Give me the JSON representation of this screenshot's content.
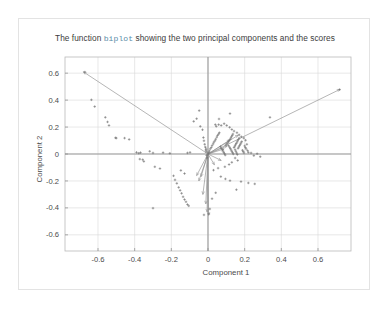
{
  "figure": {
    "title_prefix": "The function ",
    "title_code": "biplot",
    "title_suffix": " showing the two principal components and the scores",
    "title_full": "The function biplot showing the two principal components and the scores",
    "code_token_color": "#5b8ca8",
    "frame_border_color": "#e3e3e3",
    "background_color": "#ffffff"
  },
  "chart_data": {
    "type": "scatter",
    "title": "The function biplot showing the two principal components and the scores",
    "xlabel": "Component 1",
    "ylabel": "Component 2",
    "xlim": [
      -0.78,
      0.78
    ],
    "ylim": [
      -0.72,
      0.72
    ],
    "xticks": [
      -0.6,
      -0.4,
      -0.2,
      0,
      0.2,
      0.4,
      0.6
    ],
    "xticklabels": [
      "-0.6",
      "-0.4",
      "-0.2",
      "0",
      "0.2",
      "0.4",
      "0.6"
    ],
    "yticks": [
      -0.6,
      -0.4,
      -0.2,
      0,
      0.2,
      0.4,
      0.6
    ],
    "yticklabels": [
      "-0.6",
      "-0.4",
      "-0.2",
      "0",
      "0.2",
      "0.4",
      "0.6"
    ],
    "grid": true,
    "grid_color": "#d8d8d8",
    "axis_line_color": "#9a9a9a",
    "legend": null,
    "series": [
      {
        "name": "loading vectors",
        "type": "vectors",
        "color": "#8e8e8e",
        "origin": [
          0,
          0
        ],
        "vectors": [
          [
            -0.68,
            0.61
          ],
          [
            0.72,
            0.48
          ],
          [
            0.165,
            0.14
          ],
          [
            0.12,
            0.105
          ],
          [
            0.105,
            0.06
          ],
          [
            0.088,
            0.038
          ],
          [
            -0.013,
            0.05
          ],
          [
            0.035,
            -0.08
          ],
          [
            0.072,
            -0.048
          ],
          [
            -0.062,
            -0.16
          ],
          [
            -0.05,
            -0.2
          ],
          [
            -0.038,
            -0.168
          ],
          [
            -0.028,
            -0.3
          ],
          [
            -0.012,
            -0.37
          ],
          [
            -0.005,
            -0.43
          ],
          [
            0.003,
            -0.455
          ]
        ]
      },
      {
        "name": "scores",
        "type": "points",
        "color": "#6e6e6e",
        "points": [
          [
            -0.672,
            0.608
          ],
          [
            -0.636,
            0.402
          ],
          [
            -0.618,
            0.352
          ],
          [
            -0.56,
            0.272
          ],
          [
            -0.548,
            0.238
          ],
          [
            -0.54,
            0.212
          ],
          [
            -0.505,
            0.12
          ],
          [
            -0.5,
            0.118
          ],
          [
            -0.455,
            0.118
          ],
          [
            -0.43,
            0.108
          ],
          [
            -0.39,
            0.012
          ],
          [
            -0.378,
            0.006
          ],
          [
            -0.368,
            0.01
          ],
          [
            -0.372,
            -0.038
          ],
          [
            -0.356,
            -0.042
          ],
          [
            -0.35,
            -0.055
          ],
          [
            -0.318,
            0.02
          ],
          [
            -0.3,
            0.008
          ],
          [
            -0.29,
            -0.095
          ],
          [
            -0.262,
            -0.108
          ],
          [
            -0.245,
            0.01
          ],
          [
            -0.208,
            0.005
          ],
          [
            -0.188,
            -0.162
          ],
          [
            -0.18,
            -0.192
          ],
          [
            -0.17,
            -0.218
          ],
          [
            -0.16,
            -0.248
          ],
          [
            -0.152,
            -0.27
          ],
          [
            -0.144,
            -0.292
          ],
          [
            -0.136,
            -0.318
          ],
          [
            -0.128,
            -0.338
          ],
          [
            -0.12,
            -0.355
          ],
          [
            -0.112,
            -0.375
          ],
          [
            -0.105,
            -0.385
          ],
          [
            -0.148,
            -0.122
          ],
          [
            -0.128,
            -0.145
          ],
          [
            -0.112,
            0.008
          ],
          [
            -0.098,
            0.012
          ],
          [
            -0.078,
            0.242
          ],
          [
            -0.062,
            0.262
          ],
          [
            -0.048,
            0.322
          ],
          [
            -0.042,
            0.205
          ],
          [
            -0.03,
            0.18
          ],
          [
            -0.025,
            0.122
          ],
          [
            -0.022,
            0.098
          ],
          [
            -0.018,
            0.072
          ],
          [
            -0.015,
            0.052
          ],
          [
            -0.012,
            0.03
          ],
          [
            -0.01,
            0.016
          ],
          [
            -0.008,
            -0.01
          ],
          [
            -0.005,
            -0.028
          ],
          [
            0.0,
            0.0
          ],
          [
            0.004,
            0.01
          ],
          [
            0.008,
            0.022
          ],
          [
            0.012,
            0.038
          ],
          [
            0.018,
            0.048
          ],
          [
            0.022,
            0.062
          ],
          [
            0.028,
            0.075
          ],
          [
            0.032,
            0.088
          ],
          [
            0.038,
            0.098
          ],
          [
            0.042,
            0.11
          ],
          [
            0.048,
            0.125
          ],
          [
            0.052,
            0.138
          ],
          [
            0.058,
            0.148
          ],
          [
            0.062,
            0.158
          ],
          [
            0.068,
            0.055
          ],
          [
            0.072,
            0.042
          ],
          [
            0.078,
            0.032
          ],
          [
            0.082,
            0.022
          ],
          [
            0.086,
            0.012
          ],
          [
            0.09,
            0.002
          ],
          [
            0.094,
            -0.008
          ],
          [
            0.098,
            0.068
          ],
          [
            0.104,
            0.078
          ],
          [
            0.11,
            0.088
          ],
          [
            0.114,
            0.098
          ],
          [
            0.12,
            0.108
          ],
          [
            0.124,
            0.118
          ],
          [
            0.128,
            0.128
          ],
          [
            0.132,
            0.138
          ],
          [
            0.136,
            0.148
          ],
          [
            0.112,
            0.062
          ],
          [
            0.118,
            0.05
          ],
          [
            0.122,
            0.04
          ],
          [
            0.126,
            0.03
          ],
          [
            0.13,
            0.02
          ],
          [
            0.134,
            0.01
          ],
          [
            0.138,
            0.0
          ],
          [
            0.142,
            0.048
          ],
          [
            0.146,
            0.058
          ],
          [
            0.15,
            0.068
          ],
          [
            0.154,
            0.078
          ],
          [
            0.158,
            0.088
          ],
          [
            0.162,
            0.098
          ],
          [
            0.166,
            0.108
          ],
          [
            0.17,
            0.118
          ],
          [
            0.148,
            0.032
          ],
          [
            0.152,
            0.02
          ],
          [
            0.156,
            0.008
          ],
          [
            0.16,
            -0.004
          ],
          [
            0.164,
            0.042
          ],
          [
            0.168,
            0.052
          ],
          [
            0.172,
            0.062
          ],
          [
            0.176,
            0.072
          ],
          [
            0.18,
            0.082
          ],
          [
            0.184,
            0.092
          ],
          [
            0.188,
            0.028
          ],
          [
            0.192,
            0.018
          ],
          [
            0.196,
            0.008
          ],
          [
            0.2,
            0.06
          ],
          [
            0.204,
            0.048
          ],
          [
            0.208,
            0.038
          ],
          [
            0.212,
            0.072
          ],
          [
            0.216,
            0.025
          ],
          [
            0.22,
            0.012
          ],
          [
            0.205,
            0.102
          ],
          [
            0.195,
            0.118
          ],
          [
            0.182,
            0.128
          ],
          [
            0.17,
            0.142
          ],
          [
            0.158,
            0.158
          ],
          [
            0.142,
            0.17
          ],
          [
            0.13,
            0.182
          ],
          [
            0.118,
            0.198
          ],
          [
            0.102,
            0.212
          ],
          [
            0.088,
            0.225
          ],
          [
            0.072,
            0.212
          ],
          [
            0.058,
            0.218
          ],
          [
            0.045,
            0.205
          ],
          [
            0.12,
            0.3
          ],
          [
            0.06,
            0.26
          ],
          [
            0.04,
            0.218
          ],
          [
            0.235,
            0.008
          ],
          [
            0.25,
            -0.012
          ],
          [
            0.268,
            0.002
          ],
          [
            0.285,
            -0.02
          ],
          [
            0.148,
            -0.03
          ],
          [
            0.162,
            -0.048
          ],
          [
            0.13,
            -0.062
          ],
          [
            0.115,
            -0.078
          ],
          [
            0.092,
            -0.095
          ],
          [
            0.055,
            -0.105
          ],
          [
            0.03,
            -0.12
          ],
          [
            0.07,
            -0.168
          ],
          [
            0.095,
            -0.185
          ],
          [
            0.12,
            -0.198
          ],
          [
            0.18,
            -0.205
          ],
          [
            0.22,
            -0.215
          ],
          [
            0.255,
            -0.222
          ],
          [
            0.155,
            -0.265
          ],
          [
            0.042,
            -0.288
          ],
          [
            0.022,
            -0.332
          ],
          [
            0.01,
            -0.408
          ],
          [
            0.005,
            -0.445
          ],
          [
            -0.022,
            -0.452
          ],
          [
            -0.3,
            -0.402
          ],
          [
            0.338,
            0.272
          ],
          [
            0.718,
            0.478
          ]
        ]
      }
    ]
  }
}
